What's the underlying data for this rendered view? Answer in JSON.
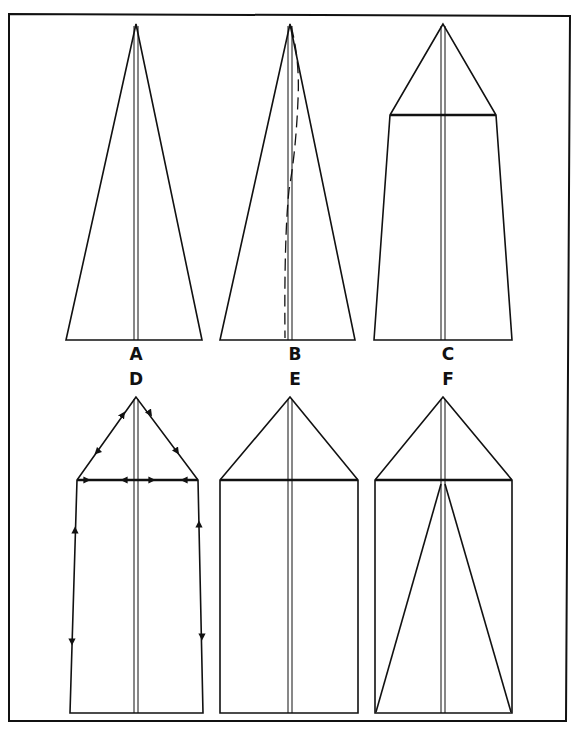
{
  "figure": {
    "line_color": "#111111",
    "background": "#ffffff",
    "panels": [
      {
        "id": "A",
        "label": "A",
        "shape": "triangle",
        "apex": [
          136,
          24
        ],
        "base_left": [
          66,
          340
        ],
        "base_right": [
          202,
          340
        ],
        "center_crease": true
      },
      {
        "id": "B",
        "label": "B",
        "shape": "triangle",
        "apex": [
          290,
          24
        ],
        "base_left": [
          220,
          340
        ],
        "base_right": [
          355,
          340
        ],
        "center_crease": true,
        "dashed_curve": true
      },
      {
        "id": "C",
        "label": "C",
        "shape": "pentagon",
        "apex": [
          443,
          24
        ],
        "shoulder_left": [
          390,
          115
        ],
        "shoulder_right": [
          496,
          115
        ],
        "base_left": [
          374,
          340
        ],
        "base_right": [
          512,
          340
        ],
        "center_crease": true
      },
      {
        "id": "D",
        "label": "D",
        "shape": "pentagon-with-arrows",
        "apex": [
          136,
          397
        ],
        "shoulder_left": [
          77,
          480
        ],
        "shoulder_right": [
          198,
          480
        ],
        "base_left": [
          70,
          713
        ],
        "base_right": [
          203,
          713
        ],
        "center_crease": true,
        "direction_arrows": true
      },
      {
        "id": "E",
        "label": "E",
        "shape": "house",
        "apex": [
          290,
          397
        ],
        "shoulder_left": [
          220,
          480
        ],
        "shoulder_right": [
          358,
          480
        ],
        "base_left": [
          220,
          713
        ],
        "base_right": [
          358,
          713
        ],
        "center_crease": true
      },
      {
        "id": "F",
        "label": "F",
        "shape": "house-with-diagonals",
        "apex": [
          443,
          397
        ],
        "shoulder_left": [
          375,
          480
        ],
        "shoulder_right": [
          512,
          480
        ],
        "base_left": [
          375,
          713
        ],
        "base_right": [
          512,
          713
        ],
        "center_crease": true,
        "inner_fold_lines": true
      }
    ]
  }
}
